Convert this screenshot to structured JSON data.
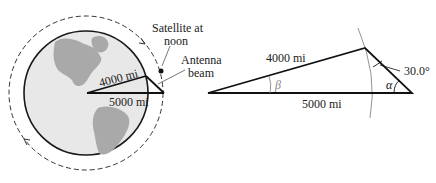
{
  "left_figure": {
    "earth_radius_label": "4000 mi",
    "orbit_radius_label": "5000 mi",
    "satellite_label_line1": "Satellite at",
    "satellite_label_line2": "noon",
    "antenna_label_line1": "Antenna",
    "antenna_label_line2": "beam"
  },
  "right_figure": {
    "side_top_label": "4000 mi",
    "side_bottom_label": "5000 mi",
    "angle_given_label": "30.0°",
    "angle_alpha_label": "α",
    "angle_beta_label": "β"
  },
  "colors": {
    "line": "#1a1a1a",
    "earth_fill": "#e6e6e6",
    "land": "#a8a8a8",
    "thin_arc": "#888888",
    "beta_color": "#888888"
  }
}
